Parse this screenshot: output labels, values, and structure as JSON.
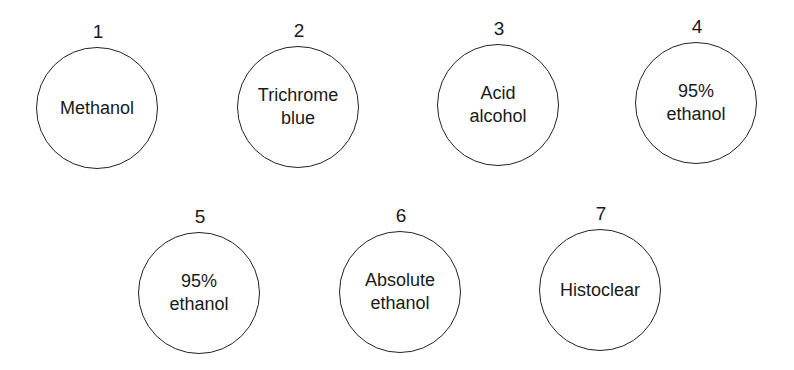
{
  "diagram": {
    "type": "staining-sequence",
    "steps": [
      {
        "number": "1",
        "label": "Methanol"
      },
      {
        "number": "2",
        "label": "Trichrome\nblue"
      },
      {
        "number": "3",
        "label": "Acid\nalcohol"
      },
      {
        "number": "4",
        "label": "95%\nethanol"
      },
      {
        "number": "5",
        "label": "95%\nethanol"
      },
      {
        "number": "6",
        "label": "Absolute\nethanol"
      },
      {
        "number": "7",
        "label": "Histoclear"
      }
    ]
  }
}
